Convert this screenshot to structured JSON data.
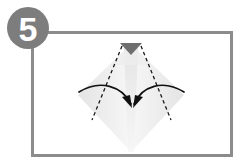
{
  "diagram": {
    "step_number": "5",
    "panel": {
      "border_color": "#8c8c8c",
      "background_color": "#ffffff",
      "x": 31,
      "y": 31,
      "width": 202,
      "height": 126
    },
    "badge": {
      "shape": "circle",
      "fill_color": "#7d7d7d",
      "center_x": 28,
      "center_y": 28,
      "radius": 21,
      "label": "5"
    },
    "paper": {
      "shape": "diamond",
      "label": "folded paper diamond",
      "fill_color": "#f2f2f2",
      "shade_color": "#e6e6e6",
      "center_x": 131,
      "top_y": 44,
      "bottom_y": 152,
      "left_x": 78,
      "right_x": 184
    },
    "flap": {
      "shape": "triangle",
      "label": "dark flap",
      "fill_color": "#6e6e6e",
      "points": "120,43 142,43 131,55"
    },
    "fold_lines": [
      {
        "name": "left-fold-crease",
        "style": "dashed",
        "color": "#1a1a1a",
        "from": [
          122,
          46
        ],
        "to": [
          92,
          120
        ]
      },
      {
        "name": "right-fold-crease",
        "style": "dashed",
        "color": "#1a1a1a",
        "from": [
          141,
          46
        ],
        "to": [
          171,
          120
        ]
      }
    ],
    "arrows": [
      {
        "name": "left-fold-arrow",
        "direction": "left-to-center",
        "color": "#111111",
        "path": "M 79,92 C 100,79 122,86 131,105",
        "head_points": "131,106 123,98 128,96"
      },
      {
        "name": "right-fold-arrow",
        "direction": "right-to-center",
        "color": "#111111",
        "path": "M 184,92 C 163,79 141,86 133,105",
        "head_points": "133,106 141,98 136,96"
      }
    ]
  }
}
